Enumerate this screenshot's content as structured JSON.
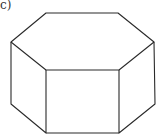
{
  "figure": {
    "label": "c)",
    "shape": "hexagonal prism",
    "stroke_color": "#2a2a2a"
  }
}
